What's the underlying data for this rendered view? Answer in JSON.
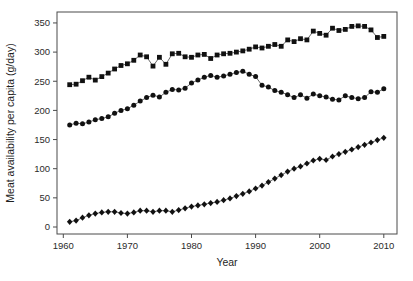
{
  "chart_data": {
    "type": "scatter",
    "title": "",
    "xlabel": "Year",
    "ylabel": "Meat availability per capita (g/day)",
    "x_ticks": [
      1960,
      1970,
      1980,
      1990,
      2000,
      2010
    ],
    "y_ticks": [
      0,
      50,
      100,
      150,
      200,
      250,
      300,
      350
    ],
    "xlim": [
      1959,
      2012
    ],
    "ylim": [
      -12,
      373
    ],
    "grid": false,
    "legend": "none",
    "x": [
      1961,
      1962,
      1963,
      1964,
      1965,
      1966,
      1967,
      1968,
      1969,
      1970,
      1971,
      1972,
      1973,
      1974,
      1975,
      1976,
      1977,
      1978,
      1979,
      1980,
      1981,
      1982,
      1983,
      1984,
      1985,
      1986,
      1987,
      1988,
      1989,
      1990,
      1991,
      1992,
      1993,
      1994,
      1995,
      1996,
      1997,
      1998,
      1999,
      2000,
      2001,
      2002,
      2003,
      2004,
      2005,
      2006,
      2007,
      2008,
      2009,
      2010
    ],
    "series": [
      {
        "name": "squares-series",
        "marker": "square",
        "values": [
          244,
          245,
          251,
          257,
          252,
          258,
          264,
          271,
          277,
          280,
          286,
          295,
          292,
          276,
          291,
          279,
          297,
          298,
          292,
          291,
          295,
          296,
          289,
          295,
          297,
          298,
          300,
          302,
          305,
          309,
          307,
          310,
          313,
          310,
          321,
          318,
          323,
          321,
          336,
          332,
          329,
          341,
          337,
          339,
          344,
          345,
          344,
          338,
          325,
          327
        ]
      },
      {
        "name": "circles-series",
        "marker": "circle",
        "values": [
          175,
          178,
          177,
          180,
          184,
          186,
          189,
          195,
          200,
          203,
          209,
          216,
          222,
          226,
          223,
          231,
          236,
          235,
          238,
          247,
          252,
          257,
          260,
          257,
          259,
          262,
          265,
          267,
          262,
          258,
          243,
          240,
          234,
          231,
          227,
          222,
          227,
          221,
          228,
          225,
          223,
          219,
          218,
          225,
          222,
          220,
          222,
          232,
          231,
          237
        ]
      },
      {
        "name": "diamonds-series",
        "marker": "diamond",
        "values": [
          9,
          11,
          16,
          20,
          23,
          25,
          26,
          26,
          24,
          23,
          25,
          28,
          28,
          26,
          28,
          28,
          26,
          29,
          32,
          35,
          37,
          39,
          41,
          43,
          46,
          49,
          53,
          57,
          61,
          66,
          71,
          77,
          83,
          89,
          95,
          100,
          104,
          109,
          114,
          117,
          115,
          121,
          125,
          129,
          133,
          137,
          141,
          145,
          149,
          153
        ]
      }
    ],
    "colors": {
      "background": "#ffffff",
      "frame": "#4a4a4a",
      "tick_text": "#2b2b2b",
      "marker": "#111111",
      "line": "#2a2a2a"
    }
  }
}
